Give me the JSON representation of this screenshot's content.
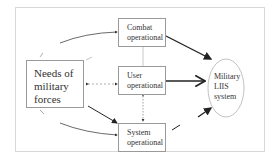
{
  "diagram": {
    "nodes": {
      "needs": {
        "label_line1": "Needs of",
        "label_line2": "military",
        "label_line3": "forces"
      },
      "combat": {
        "label_line1": "Combat",
        "label_line2": "operational"
      },
      "user": {
        "label_line1": "User",
        "label_line2": "operational"
      },
      "system": {
        "label_line1": "System",
        "label_line2": "operational"
      },
      "target": {
        "label_line1": "Military",
        "label_line2": "LIIS",
        "label_line3": "system"
      }
    },
    "edges": [
      {
        "from": "needs",
        "to": "combat",
        "style": "thin-curve"
      },
      {
        "from": "needs",
        "to": "system",
        "style": "thin-curve"
      },
      {
        "from": "needs",
        "to": "system",
        "style": "arrow"
      },
      {
        "from": "user",
        "to": "needs",
        "style": "dashed-bidirectional"
      },
      {
        "from": "user",
        "to": "system",
        "style": "bidirectional"
      },
      {
        "from": "combat",
        "to": "user",
        "style": "line"
      },
      {
        "from": "combat",
        "to": "target",
        "style": "bold-arrow"
      },
      {
        "from": "user",
        "to": "target",
        "style": "bold-arrow"
      },
      {
        "from": "system",
        "to": "target",
        "style": "bold-arrow"
      }
    ],
    "colors": {
      "line": "#222222",
      "box_border": "#9a9a9a",
      "frame": "#d8d8d8",
      "ellipse": "#bbbbbb"
    }
  }
}
